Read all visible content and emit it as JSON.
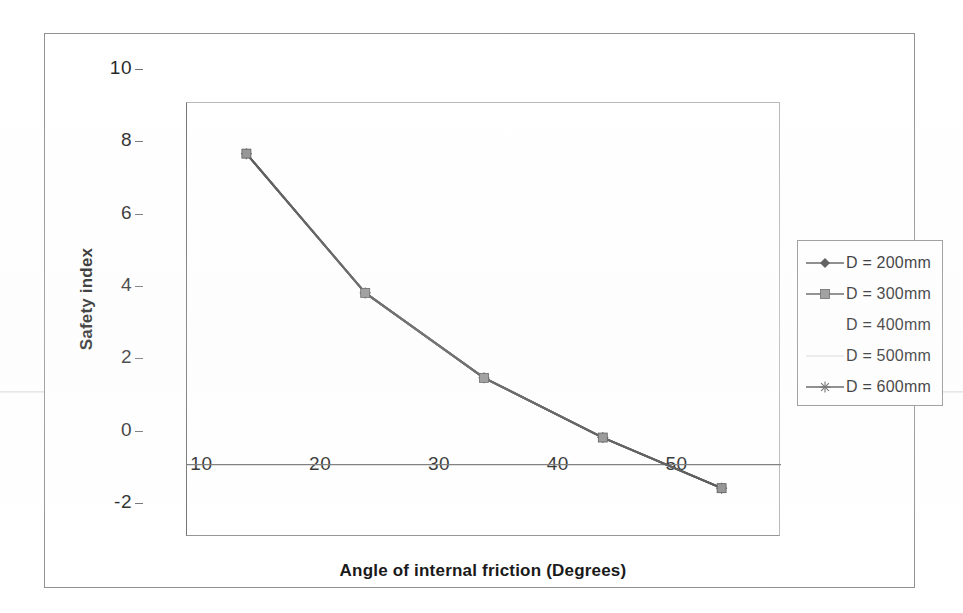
{
  "chart_data": {
    "type": "line",
    "title": "",
    "xlabel": "Angle of internal friction (Degrees)",
    "ylabel": "Safety index",
    "x": [
      10,
      20,
      30,
      40,
      50
    ],
    "xlim": [
      5,
      55
    ],
    "ylim": [
      -2,
      10
    ],
    "xticks": [
      "10",
      "20",
      "30",
      "40",
      "50"
    ],
    "yticks": [
      "10",
      "8",
      "6",
      "4",
      "2",
      "0",
      "-2"
    ],
    "grid": false,
    "legend_position": "right",
    "series": [
      {
        "name": "D = 200mm",
        "marker": "diamond",
        "values": [
          8.6,
          4.75,
          2.4,
          0.75,
          -0.65
        ]
      },
      {
        "name": "D = 300mm",
        "marker": "square",
        "values": [
          8.6,
          4.75,
          2.4,
          0.75,
          -0.65
        ]
      },
      {
        "name": "D = 400mm",
        "marker": "none",
        "values": [
          8.6,
          4.75,
          2.4,
          0.75,
          -0.65
        ]
      },
      {
        "name": "D = 500mm",
        "marker": "faint",
        "values": [
          8.6,
          4.75,
          2.4,
          0.75,
          -0.65
        ]
      },
      {
        "name": "D = 600mm",
        "marker": "asterisk",
        "values": [
          8.6,
          4.75,
          2.4,
          0.75,
          -0.65
        ]
      }
    ]
  },
  "axes": {
    "y_ticks": [
      {
        "label": "10",
        "value": 10
      },
      {
        "label": "8",
        "value": 8
      },
      {
        "label": "6",
        "value": 6
      },
      {
        "label": "4",
        "value": 4
      },
      {
        "label": "2",
        "value": 2
      },
      {
        "label": "0",
        "value": 0
      },
      {
        "label": "-2",
        "value": -2
      }
    ],
    "x_ticks": [
      {
        "label": "10",
        "value": 10
      },
      {
        "label": "20",
        "value": 20
      },
      {
        "label": "30",
        "value": 30
      },
      {
        "label": "40",
        "value": 40
      },
      {
        "label": "50",
        "value": 50
      }
    ],
    "x_title": "Angle of internal friction (Degrees)",
    "y_title": "Safety index"
  },
  "legend": {
    "entries": [
      {
        "label": "D = 200mm",
        "marker": "diamond"
      },
      {
        "label": "D = 300mm",
        "marker": "square"
      },
      {
        "label": "D = 400mm",
        "marker": "none"
      },
      {
        "label": "D = 500mm",
        "marker": "faint"
      },
      {
        "label": "D = 600mm",
        "marker": "asterisk"
      }
    ]
  },
  "colors": {
    "line": "#4a4a4a",
    "axis": "#6a6a6a",
    "frame": "#8e8e8e",
    "text": "#1a1a1a",
    "faint": "#c9c9c9"
  }
}
